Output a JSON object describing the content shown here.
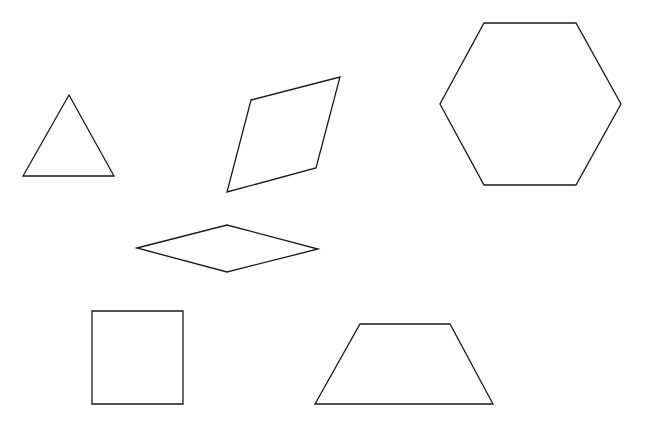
{
  "canvas": {
    "width": 666,
    "height": 435,
    "background": "#ffffff"
  },
  "style": {
    "stroke": "#1a1a1a",
    "stroke_width": 1.3
  },
  "shapes": [
    {
      "id": "triangle",
      "type": "triangle",
      "points": "69,95 114,176 23,176"
    },
    {
      "id": "rhombus-tilted",
      "type": "rhombus",
      "points": "251,100 340,77 316,168 227,192"
    },
    {
      "id": "hexagon",
      "type": "hexagon",
      "points": "484,23 576,23 621,104 576,185 484,185 440,104"
    },
    {
      "id": "rhombus-flat",
      "type": "rhombus",
      "points": "137,248 227,225 318,249 227,272"
    },
    {
      "id": "square",
      "type": "square",
      "points": "92,311 183,311 183,404 92,404"
    },
    {
      "id": "trapezoid",
      "type": "trapezoid",
      "points": "360,324 450,324 493,404 315,404"
    }
  ]
}
